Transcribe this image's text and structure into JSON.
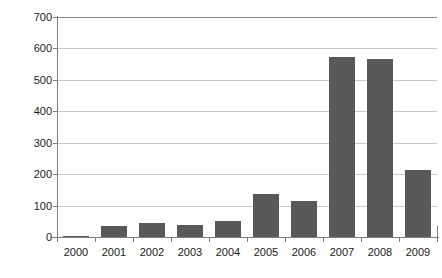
{
  "chart_data": {
    "type": "bar",
    "title": "",
    "xlabel": "",
    "ylabel": "Annual count of articles",
    "categories": [
      "2000",
      "2001",
      "2002",
      "2003",
      "2004",
      "2005",
      "2006",
      "2007",
      "2008",
      "2009"
    ],
    "values": [
      3,
      35,
      45,
      38,
      50,
      138,
      115,
      572,
      565,
      212
    ],
    "series": [
      {
        "name": "Annual count of articles",
        "values": [
          3,
          35,
          45,
          38,
          50,
          138,
          115,
          572,
          565,
          212
        ]
      }
    ],
    "ylim": [
      0,
      700
    ],
    "ytick_labels": [
      "0",
      "100",
      "200",
      "300",
      "400",
      "500",
      "600",
      "700"
    ],
    "ytick_values": [
      0,
      100,
      200,
      300,
      400,
      500,
      600,
      700
    ],
    "grid": "horizontal",
    "legend": "none",
    "bar_color": "#595959",
    "grid_color": "#c9c9c9",
    "axis_color": "#7d7d7d",
    "text_color": "#1a1a1a",
    "background": "#ffffff"
  }
}
